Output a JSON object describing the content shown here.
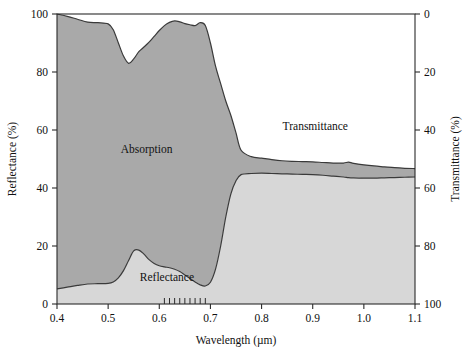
{
  "figure": {
    "background": "#ffffff",
    "plot_area": {
      "left": 57,
      "right": 415,
      "top": 14,
      "bottom": 304
    }
  },
  "chart_data": {
    "type": "area",
    "title": "",
    "subtitle": "",
    "xlabel": "Wavelength (µm)",
    "ylabel": "Reflectance (%)",
    "y2label": "Transmittance (%)",
    "xlim": [
      0.4,
      1.1
    ],
    "ylim": [
      0,
      100
    ],
    "y2lim": [
      100,
      0
    ],
    "y2_inverted": true,
    "grid": false,
    "legend": "none",
    "stacked": true,
    "x_ticks": [
      "0.4",
      "0.5",
      "0.6",
      "0.7",
      "0.8",
      "0.9",
      "1.0",
      "1.1"
    ],
    "x_tick_values": [
      0.4,
      0.5,
      0.6,
      0.7,
      0.8,
      0.9,
      1.0,
      1.1
    ],
    "x_minor_ticks": [
      0.61,
      0.62,
      0.63,
      0.64,
      0.65,
      0.66,
      0.67,
      0.68,
      0.69
    ],
    "y_ticks": [
      "0",
      "20",
      "40",
      "60",
      "80",
      "100"
    ],
    "y_tick_values": [
      0,
      20,
      40,
      60,
      80,
      100
    ],
    "y2_ticks": [
      "0",
      "20",
      "40",
      "60",
      "80",
      "100"
    ],
    "y2_tick_values": [
      0,
      20,
      40,
      60,
      80,
      100
    ],
    "annotations": [
      {
        "text": "Absorption",
        "x": 0.575,
        "y": 52
      },
      {
        "text": "Transmittance",
        "x": 0.905,
        "y": 60
      },
      {
        "text": "Reflectance",
        "x": 0.615,
        "y": 8
      }
    ],
    "colors": {
      "reflectance_fill": "#d7d7d7",
      "absorption_fill": "#a9a9a9",
      "transmittance_fill": "#ffffff",
      "curve_stroke": "#3a3a3a",
      "axis": "#2b2b2b",
      "text": "#111111"
    },
    "x": [
      0.4,
      0.42,
      0.44,
      0.46,
      0.48,
      0.5,
      0.51,
      0.52,
      0.53,
      0.54,
      0.55,
      0.56,
      0.57,
      0.58,
      0.59,
      0.6,
      0.61,
      0.62,
      0.63,
      0.64,
      0.65,
      0.66,
      0.67,
      0.68,
      0.69,
      0.7,
      0.71,
      0.72,
      0.73,
      0.74,
      0.75,
      0.76,
      0.78,
      0.8,
      0.82,
      0.84,
      0.86,
      0.88,
      0.9,
      0.92,
      0.94,
      0.96,
      0.97,
      0.98,
      1.0,
      1.02,
      1.04,
      1.06,
      1.08,
      1.1
    ],
    "series": [
      {
        "name": "Reflectance",
        "units": "%",
        "axis": "left",
        "fill": "#d7d7d7",
        "values": [
          5.2,
          5.8,
          6.4,
          6.9,
          7.0,
          7.1,
          7.6,
          9.0,
          11.5,
          15.0,
          18.3,
          18.6,
          17.2,
          15.3,
          14.0,
          13.2,
          12.8,
          12.5,
          12.0,
          11.2,
          10.0,
          8.8,
          7.6,
          6.6,
          6.2,
          7.5,
          12.0,
          20.0,
          30.0,
          38.0,
          42.5,
          44.6,
          45.0,
          45.1,
          45.0,
          44.9,
          44.8,
          44.7,
          44.6,
          44.4,
          44.1,
          43.8,
          43.6,
          43.5,
          43.4,
          43.4,
          43.5,
          43.6,
          43.7,
          43.8
        ]
      },
      {
        "name": "Absorption",
        "units": "%",
        "axis": "left",
        "fill": "#a9a9a9",
        "note": "Band between the reflectance curve and the 100-minus-transmittance curve",
        "values": [
          94.8,
          93.4,
          91.8,
          90.3,
          90.0,
          89.5,
          87.0,
          81.0,
          74.0,
          68.0,
          66.2,
          68.4,
          71.4,
          75.0,
          78.3,
          81.1,
          83.2,
          84.6,
          85.6,
          86.1,
          86.7,
          87.5,
          88.4,
          90.4,
          89.8,
          82.5,
          70.0,
          56.0,
          40.0,
          27.0,
          16.5,
          8.4,
          5.8,
          5.2,
          4.8,
          4.5,
          4.4,
          4.4,
          4.4,
          4.4,
          4.5,
          4.8,
          5.3,
          5.0,
          4.6,
          4.2,
          3.8,
          3.4,
          3.1,
          2.9
        ]
      },
      {
        "name": "Transmittance",
        "units": "%",
        "axis": "right",
        "fill": "#ffffff",
        "note": "Upper white region; transmittance read on the inverted right axis",
        "values": [
          0.0,
          0.8,
          1.8,
          2.8,
          3.0,
          3.4,
          5.4,
          10.0,
          14.5,
          17.0,
          15.5,
          13.0,
          11.4,
          9.7,
          7.7,
          5.7,
          4.0,
          2.9,
          2.4,
          2.7,
          3.3,
          3.7,
          4.0,
          3.0,
          4.0,
          10.0,
          18.0,
          24.0,
          30.0,
          35.0,
          41.0,
          47.0,
          49.2,
          49.7,
          50.2,
          50.6,
          50.8,
          50.9,
          51.0,
          51.2,
          51.4,
          51.4,
          51.1,
          51.5,
          52.0,
          52.4,
          52.7,
          53.0,
          53.2,
          53.3
        ]
      }
    ],
    "upper_boundary_reflectance_scale": {
      "name": "100 - Transmittance",
      "values": [
        100.0,
        99.2,
        98.2,
        97.2,
        97.0,
        96.6,
        94.6,
        90.0,
        85.5,
        83.0,
        84.5,
        87.0,
        88.6,
        90.3,
        92.3,
        94.3,
        96.0,
        97.1,
        97.6,
        97.3,
        96.7,
        96.3,
        96.0,
        97.0,
        96.0,
        90.0,
        82.0,
        76.0,
        70.0,
        65.0,
        59.0,
        53.0,
        50.8,
        50.3,
        49.8,
        49.4,
        49.2,
        49.1,
        49.0,
        48.8,
        48.6,
        48.6,
        48.9,
        48.5,
        48.0,
        47.6,
        47.3,
        47.0,
        46.8,
        46.7
      ]
    }
  }
}
